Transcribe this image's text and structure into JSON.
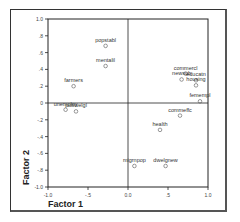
{
  "chart_data": {
    "type": "scatter",
    "title": "",
    "xlabel": "Factor 1",
    "ylabel": "Factor 2",
    "xlim": [
      -1.0,
      1.0
    ],
    "ylim": [
      -1.0,
      1.0
    ],
    "x_ticks": [
      "-1.0",
      "-.5",
      "0.0",
      ".5",
      "1.0"
    ],
    "y_ticks": [
      "1.0",
      ".8",
      ".6",
      ".4",
      ".2",
      "0",
      "-.2",
      "-.4",
      "-.6",
      "-.8",
      "-1.0"
    ],
    "grid": false,
    "reference_lines": {
      "x": 0,
      "y": 0
    },
    "legend": null,
    "points": [
      {
        "label": "popstabl",
        "x": -0.28,
        "y": 0.68
      },
      {
        "label": "mentalil",
        "x": -0.28,
        "y": 0.44
      },
      {
        "label": "farmers",
        "x": -0.68,
        "y": 0.2
      },
      {
        "label": "unemploy",
        "x": -0.78,
        "y": -0.08
      },
      {
        "label": "pubwelgl",
        "x": -0.65,
        "y": -0.1
      },
      {
        "label": "commercl",
        "x": 0.72,
        "y": 0.35
      },
      {
        "label": "newsub",
        "x": 0.67,
        "y": 0.28
      },
      {
        "label": "educatn",
        "x": 0.85,
        "y": 0.27
      },
      {
        "label": "housing",
        "x": 0.85,
        "y": 0.21
      },
      {
        "label": "femempl",
        "x": 0.9,
        "y": 0.02
      },
      {
        "label": "commeffc",
        "x": 0.65,
        "y": -0.15
      },
      {
        "label": "health",
        "x": 0.4,
        "y": -0.32
      },
      {
        "label": "migrnpop",
        "x": 0.08,
        "y": -0.75
      },
      {
        "label": "dwelgnew",
        "x": 0.47,
        "y": -0.75
      }
    ]
  }
}
